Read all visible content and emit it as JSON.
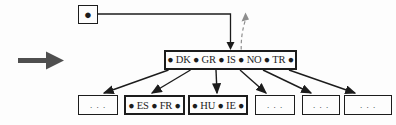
{
  "figure": {
    "kind": "b-tree-diagram",
    "colors": {
      "ink": "#1c1c1c",
      "flow_arrow": "#4f4f4f",
      "dashed_arrow": "#8e8e8e",
      "paper": "#fdfdfd"
    },
    "icons": {
      "flow_arrow": "thick-right-arrow",
      "pointer_dot": "●",
      "child_arrowhead": "filled-triangle",
      "dashed_return_arrow": "gray-dashed-up-arrow"
    },
    "tree": {
      "root_pointer_bullet": "●",
      "root_node_text": "● DK ● GR ● IS ● NO ● TR ●",
      "child_nodes": [
        ". . .",
        "● ES ● FR ●",
        "● HU ● IE ●",
        ". . .",
        ". . .",
        ". . ."
      ]
    }
  }
}
